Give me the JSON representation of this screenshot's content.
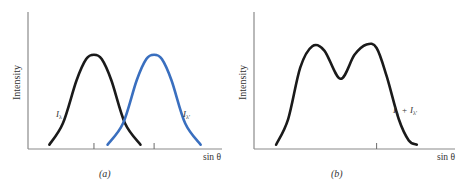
{
  "chart_data": [
    {
      "type": "line",
      "panel_caption": "(a)",
      "xlabel": "sin θ",
      "ylabel": "Intensity",
      "grid": false,
      "xlim": [
        0,
        10
      ],
      "ylim": [
        0,
        1.6
      ],
      "tick_positions": [
        3.4,
        6.5
      ],
      "series": [
        {
          "name": "I_λ",
          "label_main": "I",
          "label_sub": "λ",
          "color": "#1a1a1a",
          "x": [
            1.1,
            1.8,
            2.5,
            3.0,
            3.4,
            3.8,
            4.3,
            5.0,
            5.8
          ],
          "y": [
            0.05,
            0.3,
            0.8,
            1.05,
            1.1,
            1.05,
            0.8,
            0.3,
            0.05
          ]
        },
        {
          "name": "I_λ'",
          "label_main": "I",
          "label_sub": "λ'",
          "color": "#3a6fbf",
          "x": [
            4.1,
            4.9,
            5.6,
            6.1,
            6.5,
            6.9,
            7.4,
            8.1,
            8.9
          ],
          "y": [
            0.05,
            0.3,
            0.8,
            1.05,
            1.1,
            1.05,
            0.8,
            0.3,
            0.05
          ]
        }
      ]
    },
    {
      "type": "line",
      "panel_caption": "(b)",
      "xlabel": "sin θ",
      "ylabel": "Intensity",
      "grid": false,
      "xlim": [
        0,
        10
      ],
      "ylim": [
        0,
        1.6
      ],
      "tick_positions": [
        6.1
      ],
      "series": [
        {
          "name": "I_λ + I_λ'",
          "label_main": "I",
          "label_sub": "λ",
          "label_plus": "+",
          "label_main2": "I",
          "label_sub2": "λ'",
          "color": "#1a1a1a",
          "x": [
            1.1,
            1.7,
            2.3,
            2.9,
            3.5,
            4.3,
            5.0,
            5.6,
            6.1,
            6.6,
            7.2,
            7.7,
            8.1
          ],
          "y": [
            0.05,
            0.35,
            0.95,
            1.2,
            1.15,
            0.82,
            1.1,
            1.22,
            1.18,
            0.85,
            0.35,
            0.1,
            0.05
          ]
        }
      ]
    }
  ]
}
